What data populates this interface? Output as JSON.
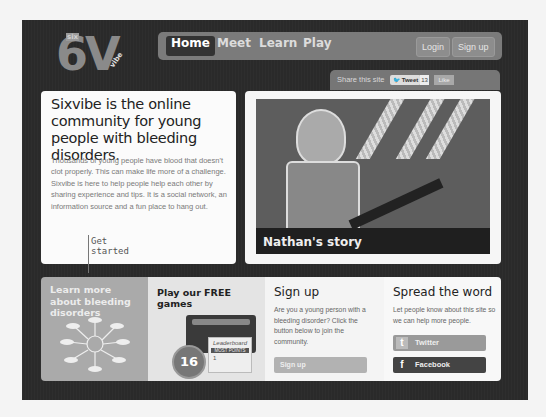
{
  "logo": {
    "big": "6V",
    "small": "six",
    "sub": "vibe"
  },
  "nav": {
    "items": [
      {
        "label": "Home",
        "active": true
      },
      {
        "label": "Meet"
      },
      {
        "label": "Learn"
      },
      {
        "label": "Play"
      }
    ],
    "login": "Login",
    "signup": "Sign up"
  },
  "share": {
    "label": "Share this site",
    "tweet": "Tweet",
    "tweet_count": "13",
    "like": "Like"
  },
  "intro": {
    "headline": "Sixvibe is the online community for young people with bleeding disorders.",
    "body": "Thousands of young people have blood that doesn't clot properly. This can make life more of a challenge. Sixvibe is here to help people help each other by sharing experience and tips. It is a social network, an information source and a fun place to hang out.",
    "get_started": "Get started"
  },
  "story": {
    "caption": "Nathan's story"
  },
  "panels": {
    "learn": {
      "title": "Learn more about bleeding disorders"
    },
    "games": {
      "title": "Play our FREE games",
      "badge": "16",
      "screen_title": "Leaderboard",
      "screen_sub": "MOST POINTS",
      "rank": "1"
    },
    "signup": {
      "title": "Sign up",
      "body": "Are you a young person with a bleeding disorder? Click the button below to join the community.",
      "button": "Sign up"
    },
    "spread": {
      "title": "Spread the word",
      "body": "Let people know about this site so we can help more people.",
      "twitter": "Twitter",
      "facebook": "Facebook"
    }
  },
  "colors": {
    "background": "#2a2a2a",
    "nav": "#7b7b7b",
    "learn_panel": "#aaaaaa",
    "facebook_button": "#444444"
  }
}
